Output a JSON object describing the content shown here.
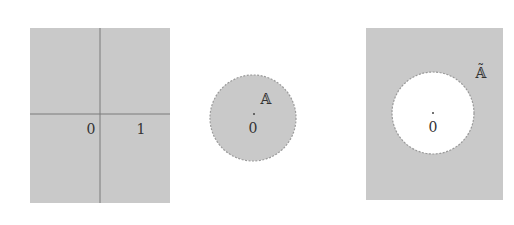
{
  "colors": {
    "fill": "#c9c9c9",
    "axis_line": "#7a7a7a",
    "dashed_border": "#9a9a9a",
    "text": "#333333",
    "background": "#ffffff"
  },
  "panel_left": {
    "description": "Full plane with coordinate axes",
    "labels": {
      "origin": "0",
      "unit": "1"
    }
  },
  "panel_middle": {
    "description": "Open disk A around origin (shaded, dashed boundary)",
    "labels": {
      "set": "𝔸",
      "origin": "0"
    }
  },
  "panel_right": {
    "description": "Complement Ã: plane minus the disk (white hole, dashed boundary)",
    "labels": {
      "set": "𝔸̃",
      "origin": "0"
    }
  }
}
